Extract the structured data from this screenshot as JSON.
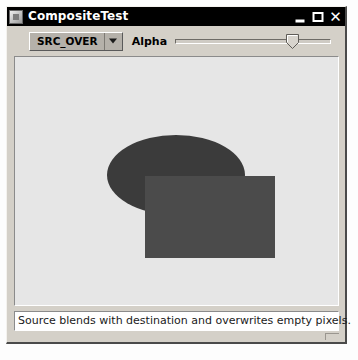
{
  "window": {
    "title": "CompositeTest",
    "icon": "java-app-icon",
    "controls": {
      "minimize": "_",
      "maximize": "□",
      "close": "✕"
    }
  },
  "toolbar": {
    "composite_mode": {
      "selected": "SRC_OVER",
      "options": [
        "SRC_OVER"
      ],
      "arrow_icon": "chevron-down-icon"
    },
    "alpha_label": "Alpha",
    "alpha_slider": {
      "value": 75,
      "min": 0,
      "max": 100
    }
  },
  "canvas": {
    "background_color": "#e6e6e6",
    "shapes": [
      {
        "name": "ellipse",
        "color": "#3b3b3b",
        "x": 92,
        "y": 78,
        "width": 138,
        "height": 80
      },
      {
        "name": "rectangle",
        "color": "#4b4b4b",
        "x": 130,
        "y": 119,
        "width": 130,
        "height": 82
      }
    ]
  },
  "statusbar": {
    "message": "Source blends with destination and overwrites empty pixels."
  },
  "colors": {
    "titlebar_bg": "#000000",
    "titlebar_fg": "#ffffff",
    "window_bg": "#d4d0c8",
    "canvas_bg": "#e6e6e6",
    "ellipse": "#3b3b3b",
    "rectangle": "#4b4b4b"
  }
}
